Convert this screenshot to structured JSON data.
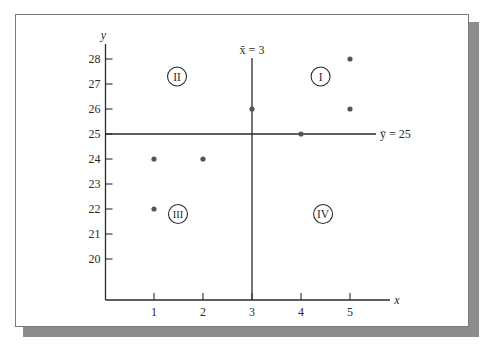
{
  "chart_data": {
    "type": "scatter",
    "title": "",
    "xlabel": "x",
    "ylabel": "y",
    "x_ticks": [
      1,
      2,
      3,
      4,
      5
    ],
    "y_ticks": [
      20,
      21,
      22,
      23,
      24,
      25,
      26,
      27,
      28
    ],
    "xlim": [
      0,
      5.8
    ],
    "ylim": [
      18.6,
      28.8
    ],
    "grid": false,
    "legend": null,
    "series": [
      {
        "name": "observations",
        "points": [
          {
            "x": 1,
            "y": 24
          },
          {
            "x": 2,
            "y": 24
          },
          {
            "x": 3,
            "y": 26
          },
          {
            "x": 4,
            "y": 25
          },
          {
            "x": 5,
            "y": 28
          },
          {
            "x": 5,
            "y": 26
          },
          {
            "x": 1,
            "y": 22
          }
        ]
      }
    ],
    "reference_lines": [
      {
        "orientation": "vertical",
        "value": 3,
        "label": "x̄ = 3"
      },
      {
        "orientation": "horizontal",
        "value": 25,
        "label": "ȳ = 25"
      }
    ],
    "annotations": [
      {
        "label": "I",
        "quadrant": "upper-right",
        "x": 4.4,
        "y": 27.3
      },
      {
        "label": "II",
        "quadrant": "upper-left",
        "x": 1.47,
        "y": 27.3
      },
      {
        "label": "III",
        "quadrant": "lower-left",
        "x": 1.49,
        "y": 21.8
      },
      {
        "label": "IV",
        "quadrant": "lower-right",
        "x": 4.45,
        "y": 21.8
      }
    ]
  },
  "colors": {
    "axis": "#2a2a2a",
    "point": "#555555",
    "frame_shadow": "#8c8c8c"
  }
}
